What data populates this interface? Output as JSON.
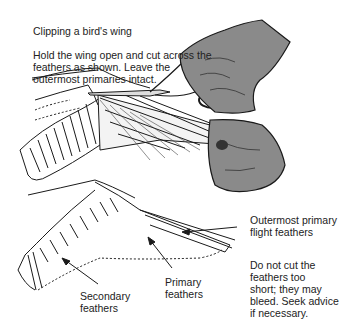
{
  "figure": {
    "title": "Clipping a bird's wing",
    "instructions": "Hold the wing open and cut across the feathers as shown. Leave the outermost primaries intact.",
    "labels": {
      "outermost_primary": "Outermost primary\nflight feathers",
      "warning": "Do not cut the\nfeathers too\nshort; they may\nbleed. Seek advice\nif necessary.",
      "primary": "Primary\nfeathers",
      "secondary": "Secondary\nfeathers"
    },
    "colors": {
      "hand": "#8a8a8a",
      "hand_dark": "#555555",
      "line": "#1a1a1a"
    }
  }
}
